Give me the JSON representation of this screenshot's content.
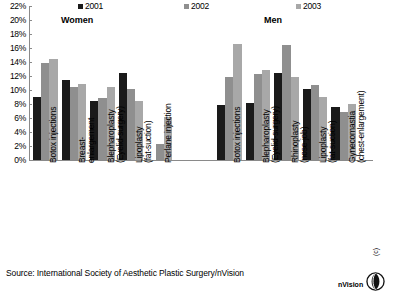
{
  "chart_data": {
    "type": "bar",
    "title": "",
    "xlabel": "",
    "ylabel": "",
    "ylim": [
      0,
      22
    ],
    "ytick_labels": [
      "22%",
      "20%",
      "18%",
      "16%",
      "14%",
      "12%",
      "10%",
      "8%",
      "6%",
      "4%",
      "2%",
      "0%"
    ],
    "ytick_values": [
      22,
      20,
      18,
      16,
      14,
      12,
      10,
      8,
      6,
      4,
      2,
      0
    ],
    "grid": false,
    "legend_position": "top",
    "legend": [
      "2001",
      "2002",
      "2003"
    ],
    "series_colors": [
      "#1a1a1a",
      "#8f8f8f",
      "#a8a8a8"
    ],
    "groups": [
      {
        "name": "Women",
        "categories": [
          "Botox injections",
          "Breast-\nenlargement",
          "Blepharoplasty\n(Eyelid-surgery)",
          "Lipoplasty\n(fat-suction)",
          "Perlane injection"
        ],
        "series": [
          {
            "name": "2001",
            "values": [
              9.0,
              11.5,
              8.4,
              12.4,
              null
            ]
          },
          {
            "name": "2002",
            "values": [
              13.8,
              10.5,
              8.9,
              10.1,
              2.3
            ]
          },
          {
            "name": "2003",
            "values": [
              14.4,
              10.8,
              10.5,
              8.5,
              6.1
            ]
          }
        ]
      },
      {
        "name": "Men",
        "categories": [
          "Botox injections",
          "Blepharoplasty\n(Eyelid-surgery)",
          "Rhinoplasty\n(nose-job)",
          "Lipoplasty\n(fat-suction)",
          "Gynecomastia\n(chest-enlargement)"
        ],
        "series": [
          {
            "name": "2001",
            "values": [
              7.8,
              8.1,
              12.5,
              10.1,
              7.6
            ]
          },
          {
            "name": "2002",
            "values": [
              11.8,
              12.3,
              16.4,
              10.7,
              6.8
            ]
          },
          {
            "name": "2003",
            "values": [
              16.6,
              12.8,
              11.8,
              9.0,
              8.0
            ]
          }
        ]
      }
    ]
  },
  "source": {
    "text": "Source: International Society of Aesthetic Plastic Surgery/nVision"
  },
  "logo": {
    "name": "nVision",
    "copyright": "(c)"
  }
}
